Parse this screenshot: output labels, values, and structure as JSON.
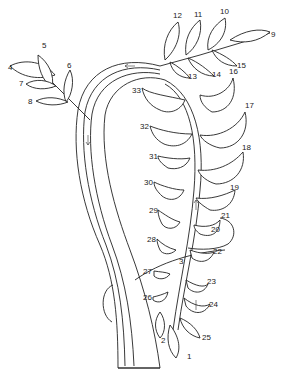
{
  "diagram": {
    "labels": [
      {
        "id": "1",
        "text": "1",
        "x": 187,
        "y": 359
      },
      {
        "id": "2",
        "text": "2",
        "x": 161,
        "y": 343
      },
      {
        "id": "3",
        "text": "3",
        "x": 179,
        "y": 264
      },
      {
        "id": "4",
        "text": "4",
        "x": 8,
        "y": 70
      },
      {
        "id": "5",
        "text": "5",
        "x": 44,
        "y": 48
      },
      {
        "id": "6",
        "text": "6",
        "x": 67,
        "y": 68
      },
      {
        "id": "7",
        "text": "7",
        "x": 19,
        "y": 84
      },
      {
        "id": "8",
        "text": "8",
        "x": 29,
        "y": 102
      },
      {
        "id": "9",
        "text": "9",
        "x": 272,
        "y": 37
      },
      {
        "id": "10",
        "text": "10",
        "x": 222,
        "y": 14
      },
      {
        "id": "11",
        "text": "11",
        "x": 196,
        "y": 17
      },
      {
        "id": "12",
        "text": "12",
        "x": 175,
        "y": 18
      },
      {
        "id": "13",
        "text": "13",
        "x": 189,
        "y": 79
      },
      {
        "id": "14",
        "text": "14",
        "x": 214,
        "y": 77
      },
      {
        "id": "15",
        "text": "15",
        "x": 237,
        "y": 67
      },
      {
        "id": "16",
        "text": "16",
        "x": 228,
        "y": 72
      },
      {
        "id": "17",
        "text": "17",
        "x": 245,
        "y": 108
      },
      {
        "id": "18",
        "text": "18",
        "x": 242,
        "y": 149
      },
      {
        "id": "19",
        "text": "19",
        "x": 230,
        "y": 188
      },
      {
        "id": "20",
        "text": "20",
        "x": 213,
        "y": 231
      },
      {
        "id": "21",
        "text": "21",
        "x": 222,
        "y": 217
      },
      {
        "id": "22",
        "text": "22",
        "x": 214,
        "y": 253
      },
      {
        "id": "23",
        "text": "23",
        "x": 208,
        "y": 284
      },
      {
        "id": "24",
        "text": "24",
        "x": 210,
        "y": 306
      },
      {
        "id": "25",
        "text": "25",
        "x": 204,
        "y": 339
      },
      {
        "id": "26",
        "text": "26",
        "x": 144,
        "y": 299
      },
      {
        "id": "27",
        "text": "27",
        "x": 144,
        "y": 273
      },
      {
        "id": "28",
        "text": "28",
        "x": 149,
        "y": 241
      },
      {
        "id": "29",
        "text": "29",
        "x": 150,
        "y": 212
      },
      {
        "id": "30",
        "text": "30",
        "x": 146,
        "y": 184
      },
      {
        "id": "31",
        "text": "31",
        "x": 150,
        "y": 158
      },
      {
        "id": "32",
        "text": "32",
        "x": 142,
        "y": 128
      },
      {
        "id": "33",
        "text": "33",
        "x": 134,
        "y": 92
      }
    ]
  }
}
